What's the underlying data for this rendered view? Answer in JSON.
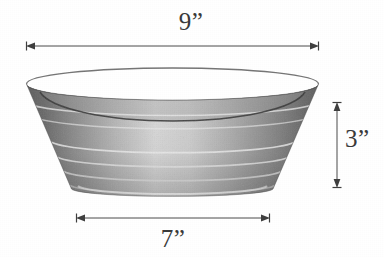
{
  "figure": {
    "units": "inches",
    "background_color": "#ffffff",
    "ink_color": "#3a3a3a"
  },
  "dimensions": {
    "top_diameter": {
      "label": "9”",
      "value": 9,
      "unit": "in",
      "orientation": "horizontal",
      "position": "above-bowl"
    },
    "base_diameter": {
      "label": "7”",
      "value": 7,
      "unit": "in",
      "orientation": "horizontal",
      "position": "below-bowl"
    },
    "height": {
      "label": "3”",
      "value": 3,
      "unit": "in",
      "orientation": "vertical",
      "position": "right-of-bowl"
    }
  },
  "bowl": {
    "rim_ellipse": {
      "cx": 172.5,
      "cy": 84,
      "rx": 146,
      "ry": 16
    },
    "base_ellipse": {
      "cx": 172.5,
      "cy": 189,
      "rx": 101,
      "ry": 8
    },
    "interior_curve_depth_px": 30,
    "band_count": 6,
    "shading": {
      "edge_tone": "#6e6e6e",
      "mid_tone": "#b5b5b5",
      "highlight_tone": "#f2f2f2",
      "rim_dark_tone": "#5a5a5a",
      "interior_line": "#3d3d3d"
    }
  }
}
